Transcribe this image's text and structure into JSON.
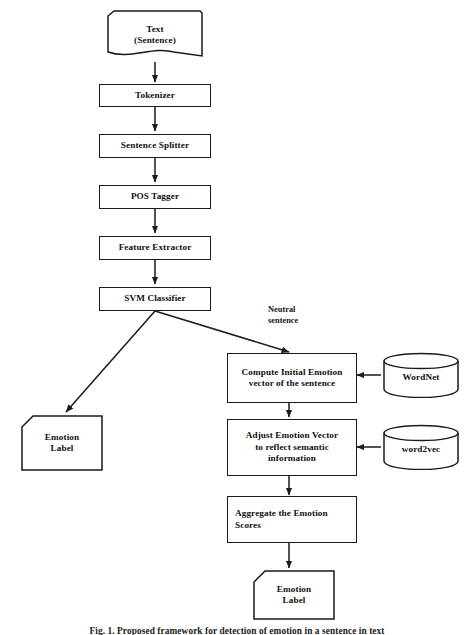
{
  "figure": {
    "caption": "Fig. 1.  Proposed framework for detection of emotion in a sentence in text",
    "type": "flowchart"
  },
  "nodes": {
    "text_input": {
      "label": "Text\n(Sentence)",
      "shape": "document"
    },
    "tokenizer": {
      "label": "Tokenizer",
      "shape": "process"
    },
    "sentence_splitter": {
      "label": "Sentence Splitter",
      "shape": "process"
    },
    "pos_tagger": {
      "label": "POS Tagger",
      "shape": "process"
    },
    "feature_extractor": {
      "label": "Feature Extractor",
      "shape": "process"
    },
    "svm_classifier": {
      "label": "SVM Classifier",
      "shape": "process"
    },
    "emotion_label_left": {
      "label": "Emotion\nLabel",
      "shape": "cut-corner"
    },
    "compute_initial_emotion": {
      "label": "Compute Initial Emotion\nvector of the sentence",
      "shape": "process"
    },
    "adjust_emotion_vector": {
      "label": "Adjust Emotion Vector\nto reflect semantic\ninformation",
      "shape": "process"
    },
    "aggregate_scores": {
      "label": "Aggregate the Emotion\nScores",
      "shape": "process"
    },
    "emotion_label_bottom": {
      "label": "Emotion\nLabel",
      "shape": "cut-corner"
    },
    "wordnet": {
      "label": "WordNet",
      "shape": "database"
    },
    "word2vec": {
      "label": "word2vec",
      "shape": "database"
    }
  },
  "annotations": {
    "neutral_sentence": "Neutral\nsentence"
  },
  "colors": {
    "stroke": "#1a1a1a",
    "fill": "#ffffff",
    "text": "#101010"
  }
}
